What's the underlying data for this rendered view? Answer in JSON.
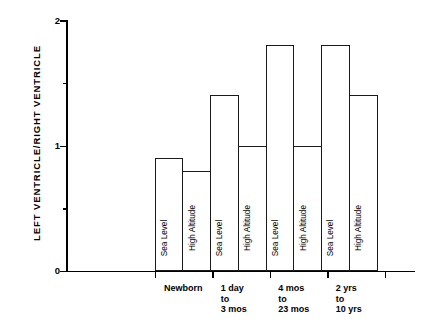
{
  "chart_data": {
    "type": "bar",
    "title": "",
    "xlabel": "",
    "ylabel": "LEFT VENTRICLE/RIGHT VENTRICLE",
    "ylim": [
      0,
      2
    ],
    "ytick_labels": [
      "0",
      "1",
      "2"
    ],
    "ytick_values": [
      0,
      1,
      2
    ],
    "yminor_ticks": [
      0.5,
      1.5
    ],
    "grid": false,
    "legend": "none",
    "bar_style": "outlined-unfilled",
    "categories": [
      "Newborn",
      "1 day to 3 mos",
      "4 mos to 23 mos",
      "2 yrs to 10 yrs"
    ],
    "series": [
      {
        "name": "Sea Level",
        "values": [
          0.9,
          1.4,
          1.8,
          1.8
        ]
      },
      {
        "name": "High Altitude",
        "values": [
          0.8,
          1.0,
          1.0,
          1.4
        ]
      }
    ],
    "bars": [
      {
        "group": "Newborn",
        "condition": "Sea Level",
        "value": 0.9
      },
      {
        "group": "Newborn",
        "condition": "High Altitude",
        "value": 0.8
      },
      {
        "group": "1 day to 3 mos",
        "condition": "Sea Level",
        "value": 1.4
      },
      {
        "group": "1 day to 3 mos",
        "condition": "High Altitude",
        "value": 1.0
      },
      {
        "group": "4 mos to 23 mos",
        "condition": "Sea Level",
        "value": 1.8
      },
      {
        "group": "4 mos to 23 mos",
        "condition": "High Altitude",
        "value": 1.0
      },
      {
        "group": "2 yrs to 10 yrs",
        "condition": "Sea Level",
        "value": 1.8
      },
      {
        "group": "2 yrs to 10 yrs",
        "condition": "High Altitude",
        "value": 1.4
      }
    ],
    "group_labels": [
      {
        "lines": [
          "Newborn"
        ]
      },
      {
        "lines": [
          "1 day",
          "to",
          "3 mos"
        ]
      },
      {
        "lines": [
          "4 mos",
          "to",
          "23 mos"
        ]
      },
      {
        "lines": [
          "2 yrs",
          "to",
          "10 yrs"
        ]
      }
    ],
    "colors": {
      "bar_outline": "#1a1a1a",
      "bar_fill": "#ffffff",
      "axis": "#000000",
      "text": "#000000",
      "background": "#ffffff"
    }
  }
}
